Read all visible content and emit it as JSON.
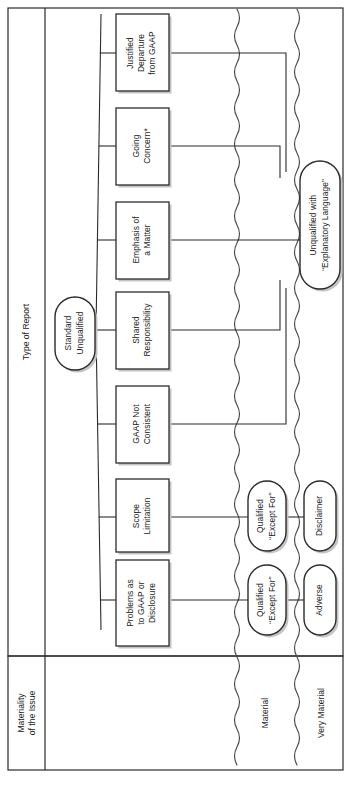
{
  "diagram": {
    "row_headers": [
      {
        "id": "type-of-report",
        "label": "Type of Report"
      },
      {
        "id": "materiality-of-the-issue",
        "label": "Materiality of the Issue",
        "line1": "Materiality",
        "line2": "of the Issue"
      }
    ],
    "materiality_columns": [
      {
        "id": "immaterial",
        "label": ""
      },
      {
        "id": "material",
        "label": "Material"
      },
      {
        "id": "very-material",
        "label": "Very Material"
      }
    ],
    "source_node": {
      "id": "standard-unqualified",
      "line1": "Standard",
      "line2": "Unqualified"
    },
    "issue_boxes": [
      {
        "id": "justified-departure-from-gaap",
        "lines": [
          "Justified",
          "Departure",
          "from GAAP"
        ]
      },
      {
        "id": "going-concern",
        "lines": [
          "Going",
          "Concern*"
        ]
      },
      {
        "id": "emphasis-of-a-matter",
        "lines": [
          "Emphasis of",
          "a Matter"
        ]
      },
      {
        "id": "shared-responsibility",
        "lines": [
          "Shared",
          "Responsibility"
        ]
      },
      {
        "id": "gaap-not-consistent",
        "lines": [
          "GAAP Not",
          "Consistent"
        ]
      },
      {
        "id": "scope-limitation",
        "lines": [
          "Scope",
          "Limitation"
        ]
      },
      {
        "id": "problems-as-to-gaap-or-disclosure",
        "lines": [
          "Problems as",
          "to GAAP or",
          "Disclosure"
        ]
      }
    ],
    "outcome_nodes": [
      {
        "id": "unqualified-with-explanatory-language",
        "lines": [
          "Unqualified with",
          "“Explanatory Language”"
        ],
        "column": "immaterial-material-boundary"
      },
      {
        "id": "qualified-except-for-scope",
        "lines": [
          "Qualified",
          "“Except For”"
        ],
        "column": "material"
      },
      {
        "id": "disclaimer",
        "lines": [
          "Disclaimer"
        ],
        "column": "very-material"
      },
      {
        "id": "qualified-except-for-gaap",
        "lines": [
          "Qualified",
          "“Except For”"
        ],
        "column": "material"
      },
      {
        "id": "adverse",
        "lines": [
          "Adverse"
        ],
        "column": "very-material"
      }
    ],
    "colors": {
      "line": "#2b2b2b",
      "text": "#1a1a1a",
      "background": "#ffffff",
      "shadow": "#b9b9b9"
    }
  }
}
